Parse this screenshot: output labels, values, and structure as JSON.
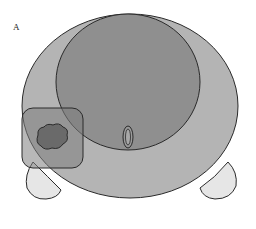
{
  "figure": {
    "panel_label": "A",
    "colors": {
      "outer_body": "#b4b4b4",
      "inner_region": "#8f8f8f",
      "box_region": "#7e7e7e",
      "lesion": "#6a6a6a",
      "small_oval": "#9a9a9a",
      "lobes": "#e6e6e6",
      "outline": "#2a2a2a"
    }
  }
}
